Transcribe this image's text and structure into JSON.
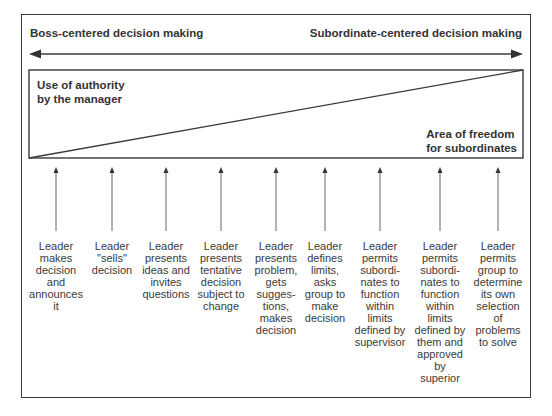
{
  "diagram": {
    "header": {
      "left_label": "Boss-centered decision making",
      "right_label": "Subordinate-centered decision making"
    },
    "regions": {
      "authority_label": [
        "Use of authority",
        "by the manager"
      ],
      "freedom_label": [
        "Area of freedom",
        "for subordinates"
      ]
    },
    "behaviors": [
      {
        "x": 56,
        "lines": [
          "Leader",
          "makes",
          "decision",
          "and",
          "announces",
          "it"
        ]
      },
      {
        "x": 112,
        "lines": [
          "Leader",
          "\"sells\"",
          "decision"
        ]
      },
      {
        "x": 166,
        "lines": [
          "Leader",
          "presents",
          "ideas and",
          "invites",
          "questions"
        ]
      },
      {
        "x": 221,
        "lines": [
          "Leader",
          "presents",
          "tentative",
          "decision",
          "subject to",
          "change"
        ]
      },
      {
        "x": 276,
        "lines": [
          "Leader",
          "presents",
          "problem,",
          "gets",
          "sugges-",
          "tions,",
          "makes",
          "decision"
        ]
      },
      {
        "x": 325,
        "lines": [
          "Leader",
          "defines",
          "limits,",
          "asks",
          "group to",
          "make",
          "decision"
        ]
      },
      {
        "x": 380,
        "lines": [
          "Leader",
          "permits",
          "subordi-",
          "nates to",
          "function",
          "within",
          "limits",
          "defined by",
          "supervisor"
        ]
      },
      {
        "x": 440,
        "lines": [
          "Leader",
          "permits",
          "subordi-",
          "nates to",
          "function",
          "within",
          "limits",
          "defined by",
          "them and",
          "approved",
          "by",
          "superior"
        ]
      },
      {
        "x": 498,
        "lines": [
          "Leader",
          "permits",
          "group to",
          "determine",
          "its own",
          "selection",
          "of",
          "problems",
          "to solve"
        ]
      }
    ],
    "colors": {
      "line": "#3a3a3a",
      "arrow": "#555555",
      "text": "#333333"
    }
  }
}
